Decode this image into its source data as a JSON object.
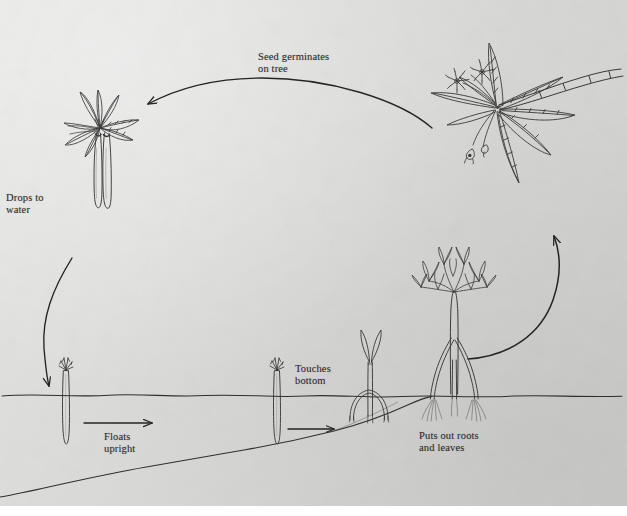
{
  "diagram": {
    "medium": "pen and ink illustration on gray paper",
    "background_color": "#d9d9d7",
    "ink_color": "#2b2b2b",
    "width": 627,
    "height": 516
  },
  "labels": {
    "seed_germinates": "Seed germinates\non tree",
    "drops_to_water": "Drops to\nwater",
    "floats_upright": "Floats\nupright",
    "touches_bottom": "Touches\nbottom",
    "puts_out_roots": "Puts out roots\nand leaves"
  },
  "stages": [
    {
      "id": "germination-on-tree",
      "label": "Seed germinates\non tree",
      "position": {
        "x": 100,
        "y": 160
      },
      "description": "leafy branch tip with two long pendant propagules hanging down"
    },
    {
      "id": "floating-propagule",
      "label": "Floats\nupright",
      "position": {
        "x": 66,
        "y": 395
      },
      "description": "slender propagule floating vertically, tip just above the water line"
    },
    {
      "id": "touching-bottom",
      "label": "Touches\nbottom",
      "position": {
        "x": 277,
        "y": 395
      },
      "description": "propagule drifting right, lower end reaching the sloping sea floor"
    },
    {
      "id": "rooting-seedling",
      "label": "",
      "position": {
        "x": 370,
        "y": 375
      },
      "description": "young seedling with two first leaves and small arching prop roots"
    },
    {
      "id": "young-tree",
      "label": "Puts out roots\nand leaves",
      "position": {
        "x": 455,
        "y": 320
      },
      "description": "sapling with a crown of leaves and spreading stilt roots anchored in the mud"
    },
    {
      "id": "mature-tree",
      "label": "",
      "position": {
        "x": 510,
        "y": 120
      },
      "description": "mature mangrove branch with lance-shaped leaves, star-like flowers and a new propagule"
    }
  ],
  "arrows": [
    {
      "id": "arc-top",
      "from": "mature-tree",
      "to": "germination-on-tree",
      "direction": "right-to-left",
      "style": "long shallow arc across the top"
    },
    {
      "id": "arc-left",
      "from": "germination-on-tree",
      "to": "floating-propagule",
      "direction": "downward",
      "style": "curved arc down the left side"
    },
    {
      "id": "straight-1",
      "from": "floating-propagule",
      "to": "touching-bottom",
      "direction": "left-to-right",
      "style": "short straight arrow"
    },
    {
      "id": "straight-2",
      "from": "touching-bottom",
      "to": "rooting-seedling",
      "direction": "left-to-right",
      "style": "short straight arrow"
    },
    {
      "id": "arc-right",
      "from": "young-tree",
      "to": "mature-tree",
      "direction": "upward",
      "style": "large arc sweeping up the right side"
    }
  ],
  "scene": {
    "water_line_y": 395,
    "sea_floor": "slopes up from lower-left to meet the water surface near x=430"
  }
}
